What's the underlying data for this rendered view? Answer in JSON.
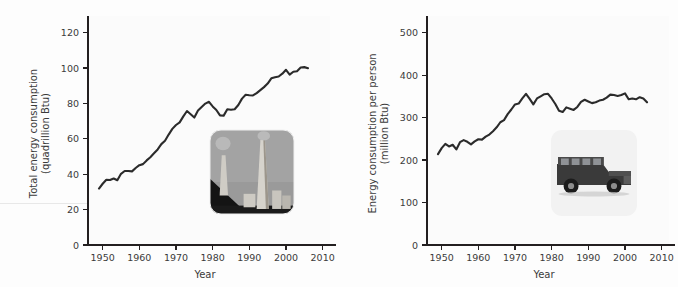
{
  "figure": {
    "background_color": "#fdfdfd",
    "line_color": "#2b2b2b",
    "text_color": "#3b3b3b"
  },
  "panels": [
    {
      "id": "total-energy-consumption",
      "inset_icon": "power-plant-smokestacks-photo",
      "inset_caption": "power plant smokestacks"
    },
    {
      "id": "energy-consumption-per-person",
      "inset_icon": "hummer-suv-photo",
      "inset_caption": "Hummer sport utility vehicle"
    }
  ],
  "chart_data": [
    {
      "type": "line",
      "title": "",
      "xlabel": "Year",
      "ylabel": "Total energy consumption\n(quadrillion Btu)",
      "ylabel_line1": "Total energy consumption",
      "ylabel_line2": "(quadrillion Btu)",
      "xlim": [
        1946,
        2012
      ],
      "ylim": [
        0,
        126
      ],
      "xticks": [
        1950,
        1960,
        1970,
        1980,
        1990,
        2000,
        2010
      ],
      "yticks": [
        0,
        20,
        40,
        60,
        80,
        100,
        120
      ],
      "grid": false,
      "legend": "none",
      "x": [
        1949,
        1950,
        1951,
        1952,
        1953,
        1954,
        1955,
        1956,
        1957,
        1958,
        1959,
        1960,
        1961,
        1962,
        1963,
        1964,
        1965,
        1966,
        1967,
        1968,
        1969,
        1970,
        1971,
        1972,
        1973,
        1974,
        1975,
        1976,
        1977,
        1978,
        1979,
        1980,
        1981,
        1982,
        1983,
        1984,
        1985,
        1986,
        1987,
        1988,
        1989,
        1990,
        1991,
        1992,
        1993,
        1994,
        1995,
        1996,
        1997,
        1998,
        1999,
        2000,
        2001,
        2002,
        2003,
        2004,
        2005,
        2006
      ],
      "values": [
        31.9,
        34.6,
        36.9,
        36.7,
        37.6,
        36.6,
        40.2,
        41.8,
        41.8,
        41.6,
        43.5,
        45.1,
        45.7,
        47.8,
        49.6,
        51.8,
        54.0,
        57.0,
        58.9,
        62.4,
        65.6,
        67.8,
        69.3,
        72.7,
        75.7,
        73.9,
        72.0,
        76.0,
        78.0,
        79.9,
        80.9,
        78.3,
        76.3,
        73.2,
        73.1,
        76.7,
        76.4,
        76.7,
        79.1,
        82.7,
        84.9,
        84.6,
        84.5,
        85.8,
        87.5,
        89.2,
        91.2,
        94.2,
        94.8,
        95.2,
        96.8,
        99.0,
        96.3,
        97.9,
        98.2,
        100.3,
        100.5,
        99.9
      ]
    },
    {
      "type": "line",
      "title": "",
      "xlabel": "Year",
      "ylabel": "Energy consumption per person\n(million Btu)",
      "ylabel_line1": "Energy consumption per person",
      "ylabel_line2": "(million Btu)",
      "xlim": [
        1946,
        2012
      ],
      "ylim": [
        0,
        525
      ],
      "xticks": [
        1950,
        1960,
        1970,
        1980,
        1990,
        2000,
        2010
      ],
      "yticks": [
        0,
        100,
        200,
        300,
        400,
        500
      ],
      "grid": false,
      "legend": "none",
      "x": [
        1949,
        1950,
        1951,
        1952,
        1953,
        1954,
        1955,
        1956,
        1957,
        1958,
        1959,
        1960,
        1961,
        1962,
        1963,
        1964,
        1965,
        1966,
        1967,
        1968,
        1969,
        1970,
        1971,
        1972,
        1973,
        1974,
        1975,
        1976,
        1977,
        1978,
        1979,
        1980,
        1981,
        1982,
        1983,
        1984,
        1985,
        1986,
        1987,
        1988,
        1989,
        1990,
        1991,
        1992,
        1993,
        1994,
        1995,
        1996,
        1997,
        1998,
        1999,
        2000,
        2001,
        2002,
        2003,
        2004,
        2005,
        2006
      ],
      "values": [
        214,
        228,
        238,
        232,
        236,
        225,
        242,
        247,
        243,
        237,
        244,
        249,
        248,
        255,
        260,
        268,
        277,
        289,
        294,
        308,
        319,
        331,
        333,
        345,
        356,
        344,
        331,
        345,
        350,
        355,
        356,
        345,
        332,
        316,
        313,
        324,
        321,
        318,
        325,
        337,
        342,
        338,
        334,
        336,
        340,
        342,
        347,
        354,
        353,
        351,
        353,
        357,
        343,
        345,
        343,
        348,
        345,
        336
      ]
    }
  ],
  "axis": {
    "xlabel": "Year"
  }
}
